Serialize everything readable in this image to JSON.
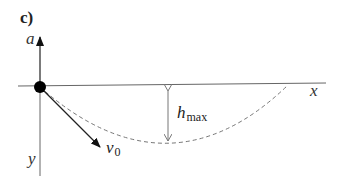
{
  "figure": {
    "panel_label": "c)",
    "axes": {
      "vertical_up_label": "a",
      "vertical_down_label": "y",
      "horizontal_label": "x"
    },
    "velocity": {
      "symbol": "v",
      "subscript": "0"
    },
    "height": {
      "symbol": "h",
      "subscript": "max"
    },
    "colors": {
      "axis": "#555555",
      "dot": "#000000",
      "trajectory": "#777777",
      "text": "#222222"
    }
  }
}
